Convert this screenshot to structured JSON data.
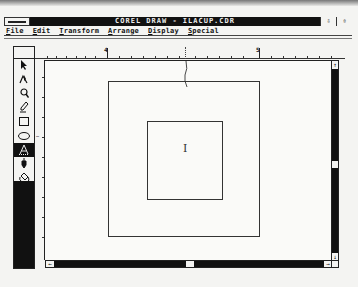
{
  "window": {
    "title": "COREL DRAW - ILACUP.CDR",
    "buttons": {
      "minimize": "⇩",
      "maximize": "⇳"
    }
  },
  "menubar": {
    "items": [
      {
        "label": "File",
        "mnemonic": "F",
        "rest": "ile"
      },
      {
        "label": "Edit",
        "mnemonic": "E",
        "rest": "dit"
      },
      {
        "label": "Transform",
        "mnemonic": "T",
        "rest": "ransform"
      },
      {
        "label": "Arrange",
        "mnemonic": "A",
        "rest": "rrange"
      },
      {
        "label": "Display",
        "mnemonic": "D",
        "rest": "isplay"
      },
      {
        "label": "Special",
        "mnemonic": "S",
        "rest": "pecial"
      }
    ]
  },
  "toolbox": {
    "tools": [
      {
        "name": "pick-tool",
        "glyph": "➤",
        "active": false
      },
      {
        "name": "shape-tool",
        "glyph": "⋏",
        "active": false
      },
      {
        "name": "zoom-tool",
        "glyph": "🔍",
        "active": false
      },
      {
        "name": "pencil-tool",
        "glyph": "✎",
        "active": false
      },
      {
        "name": "rectangle-tool",
        "glyph": "□",
        "active": false
      },
      {
        "name": "ellipse-tool",
        "glyph": "⬭",
        "active": false
      },
      {
        "name": "text-tool",
        "glyph": "A",
        "active": true
      },
      {
        "name": "outline-tool",
        "glyph": "✒",
        "active": false
      },
      {
        "name": "fill-tool",
        "glyph": "♨",
        "active": false
      }
    ]
  },
  "ruler": {
    "horizontal_labels": [
      {
        "value": "4",
        "x": 70
      },
      {
        "value": "5",
        "x": 220
      }
    ]
  },
  "scrollbars": {
    "up_arrow": "↑",
    "down_arrow": "↓",
    "left_arrow": "←",
    "right_arrow": "→"
  },
  "canvas": {
    "cursor_glyph": "I"
  },
  "colors": {
    "title_bg": "#111111",
    "title_fg": "#eeeeee",
    "canvas_bg": "#fafaf8",
    "scroll_bg": "#111111"
  }
}
